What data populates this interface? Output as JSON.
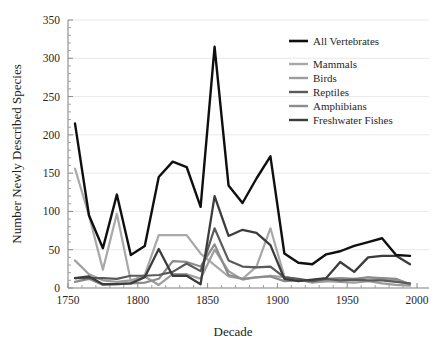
{
  "chart_data": {
    "type": "line",
    "title": "",
    "xlabel": "Decade",
    "ylabel": "Number Newly Described Species",
    "xlim": [
      1750,
      2000
    ],
    "ylim": [
      0,
      350
    ],
    "xticks": [
      1750,
      1800,
      1850,
      1900,
      1950,
      2000
    ],
    "xtick_labels": [
      "1750",
      "1800",
      "1850",
      "1900",
      "1950",
      "2000"
    ],
    "yticks": [
      0,
      50,
      100,
      150,
      200,
      250,
      300,
      350
    ],
    "ytick_labels": [
      "0",
      "50",
      "100",
      "150",
      "200",
      "250",
      "300",
      "350"
    ],
    "minor_tick_step": 10,
    "grid": true,
    "grid_axis": "y",
    "legend_position": "top-right",
    "x": [
      1755,
      1765,
      1775,
      1785,
      1795,
      1805,
      1815,
      1825,
      1835,
      1845,
      1855,
      1865,
      1875,
      1885,
      1895,
      1905,
      1915,
      1925,
      1935,
      1945,
      1955,
      1965,
      1975,
      1985,
      1995
    ],
    "series": [
      {
        "name": "All Vertebrates",
        "color": "#100f0f",
        "width": 2.4,
        "values": [
          215,
          95,
          52,
          122,
          43,
          55,
          145,
          165,
          158,
          106,
          315,
          134,
          111,
          143,
          172,
          45,
          33,
          31,
          44,
          48,
          55,
          60,
          65,
          43,
          42
        ]
      },
      {
        "name": "Mammals",
        "color": "#a8a8a8",
        "width": 2.2,
        "values": [
          156,
          95,
          24,
          97,
          9,
          17,
          69,
          69,
          69,
          45,
          30,
          15,
          12,
          28,
          78,
          15,
          11,
          8,
          9,
          13,
          10,
          14,
          11,
          10,
          4
        ]
      },
      {
        "name": "Birds",
        "color": "#9d9d9d",
        "width": 2.2,
        "values": [
          36,
          18,
          10,
          8,
          10,
          15,
          4,
          18,
          18,
          12,
          50,
          22,
          11,
          14,
          16,
          14,
          11,
          7,
          9,
          8,
          7,
          9,
          6,
          4,
          3
        ]
      },
      {
        "name": "Reptiles",
        "color": "#5a5a5a",
        "width": 2.2,
        "values": [
          13,
          13,
          13,
          12,
          16,
          16,
          17,
          21,
          32,
          22,
          78,
          36,
          28,
          27,
          28,
          14,
          12,
          9,
          12,
          10,
          11,
          10,
          10,
          8,
          6
        ]
      },
      {
        "name": "Amphibians",
        "color": "#8c8c8c",
        "width": 2.2,
        "values": [
          8,
          12,
          4,
          5,
          6,
          7,
          12,
          35,
          34,
          28,
          57,
          17,
          12,
          14,
          15,
          9,
          10,
          9,
          12,
          13,
          12,
          14,
          13,
          12,
          5
        ]
      },
      {
        "name": "Freshwater Fishes",
        "color": "#3c3c3c",
        "width": 2.3,
        "values": [
          13,
          15,
          5,
          5,
          6,
          14,
          51,
          16,
          16,
          5,
          120,
          68,
          76,
          72,
          56,
          12,
          9,
          11,
          13,
          34,
          21,
          40,
          42,
          42,
          31
        ]
      }
    ]
  },
  "axis": {
    "x_title": "Decade",
    "y_title": "Number Newly Described Species"
  },
  "legend": {
    "entries": [
      {
        "label": "All Vertebrates",
        "color": "#100f0f"
      },
      {
        "label": "Mammals",
        "color": "#a8a8a8"
      },
      {
        "label": "Birds",
        "color": "#9d9d9d"
      },
      {
        "label": "Reptiles",
        "color": "#5a5a5a"
      },
      {
        "label": "Amphibians",
        "color": "#8c8c8c"
      },
      {
        "label": "Freshwater Fishes",
        "color": "#3c3c3c"
      }
    ]
  }
}
